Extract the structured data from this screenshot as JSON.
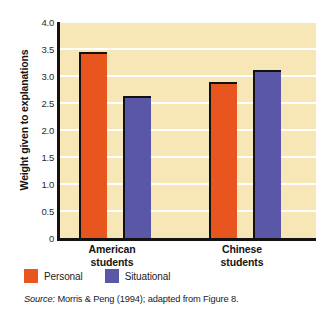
{
  "chart_data": {
    "type": "bar",
    "title": "",
    "xlabel": "",
    "ylabel": "Weight given to explanations",
    "categories": [
      "American students",
      "Chinese students"
    ],
    "category_lines": [
      [
        "American",
        "students"
      ],
      [
        "Chinese",
        "students"
      ]
    ],
    "series": [
      {
        "name": "Personal",
        "color": "#e8551f",
        "values": [
          3.45,
          2.88
        ]
      },
      {
        "name": "Situational",
        "color": "#5b57a8",
        "values": [
          2.63,
          3.12
        ]
      }
    ],
    "ylim": [
      0,
      4.0
    ],
    "yticks": [
      0,
      0.5,
      1.0,
      1.5,
      2.0,
      2.5,
      3.0,
      3.5,
      4.0
    ],
    "ytick_labels": [
      "0",
      "0.5",
      "1.0",
      "1.5",
      "2.0",
      "2.5",
      "3.0",
      "3.5",
      "4.0"
    ],
    "grid": true,
    "grid_color": "#ffffff",
    "plot_background": "#f7e7b6",
    "legend_position": "below-axes"
  },
  "legend": {
    "items": [
      {
        "label": "Personal",
        "color": "#e8551f"
      },
      {
        "label": "Situational",
        "color": "#5b57a8"
      }
    ]
  },
  "source": {
    "prefix": "Source:",
    "text": " Morris & Peng (1994); adapted from Figure 8."
  }
}
